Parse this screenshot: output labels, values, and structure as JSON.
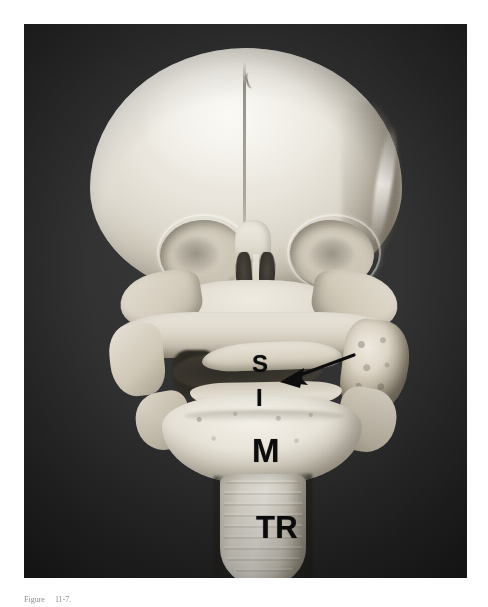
{
  "figure": {
    "domain": "anatomical-photograph",
    "view": "anterior view of infant skull with dissected neck",
    "photo_background_color": "#2c2c2c",
    "bone_color": "#e9e4d9",
    "label_color": "#0c0c0c"
  },
  "labels": {
    "supraglottis": "S",
    "infraglottis": "I",
    "mandible": "M",
    "trachea": "TR"
  },
  "annotations": {
    "arrow": {
      "name": "leader-arrow",
      "direction": "points left and slightly down",
      "color": "#0d0d0d",
      "tail_x": 330,
      "tail_y": 331,
      "head_x": 258,
      "head_y": 356
    }
  },
  "caption": {
    "number": "Figure",
    "text": "11-7."
  }
}
